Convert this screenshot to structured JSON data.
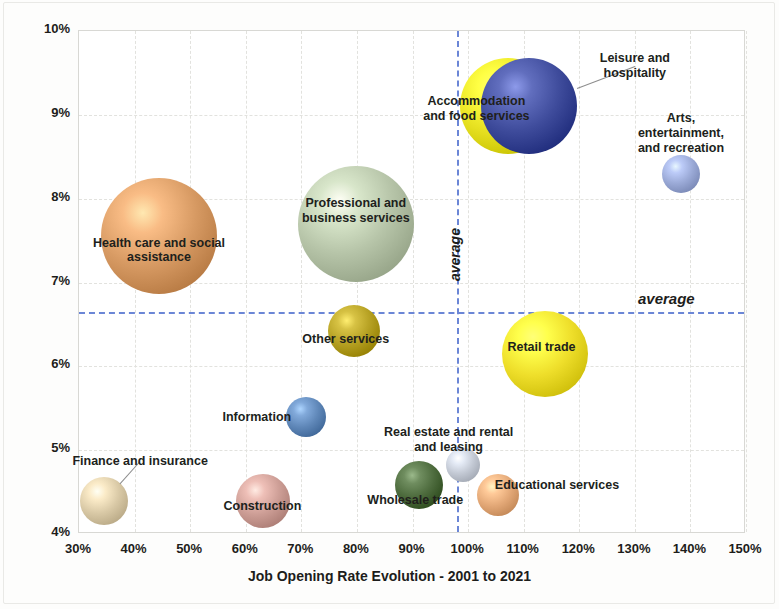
{
  "chart_data": {
    "type": "scatter",
    "title": "",
    "xlabel": "Job Opening Rate Evolution - 2001 to 2021",
    "ylabel": "Job Opening Rate (as a % Jobs) in 2021",
    "xlim": [
      30,
      150
    ],
    "ylim": [
      4,
      10
    ],
    "xticks": [
      "30%",
      "40%",
      "50%",
      "60%",
      "70%",
      "80%",
      "90%",
      "100%",
      "110%",
      "120%",
      "130%",
      "140%",
      "150%"
    ],
    "yticks": [
      "4%",
      "5%",
      "6%",
      "7%",
      "8%",
      "9%",
      "10%"
    ],
    "grid": true,
    "legend": "none",
    "annotations": [
      {
        "text": "average",
        "orientation": "vertical",
        "x": 98
      },
      {
        "text": "average",
        "orientation": "horizontal",
        "y": 6.65
      }
    ],
    "reference_lines": {
      "vertical_average_x": 98,
      "horizontal_average_y": 6.65,
      "color": "#6b86d6",
      "style": "dashed"
    },
    "points": [
      {
        "label": "Health care and social\nassistance",
        "x": 44.4,
        "y": 7.55,
        "size_r": 58,
        "color": "#d79a63",
        "label_x": 44.4,
        "label_y": 7.38,
        "leader": false
      },
      {
        "label": "Professional and\nbusiness services",
        "x": 79.8,
        "y": 7.7,
        "size_r": 58,
        "color": "#b6c4a8",
        "label_x": 79.8,
        "label_y": 7.85,
        "leader": false
      },
      {
        "label": "Accommodation\nand food services",
        "x": 107.2,
        "y": 9.1,
        "size_r": 48,
        "color": "#e8e222",
        "label_x": 101.5,
        "label_y": 9.07,
        "leader": false
      },
      {
        "label": "Leisure and hospitality",
        "x": 111.0,
        "y": 9.1,
        "size_r": 48,
        "color": "#3f4c9c",
        "label_x": 130.0,
        "label_y": 9.58,
        "leader": true
      },
      {
        "label": "Arts, entertainment,\nand recreation",
        "x": 138.3,
        "y": 8.3,
        "size_r": 19,
        "color": "#9aa9d6",
        "label_x": 138.3,
        "label_y": 8.78,
        "leader": false
      },
      {
        "label": "Other services",
        "x": 79.5,
        "y": 6.42,
        "size_r": 26,
        "color": "#b5a022",
        "label_x": 78.0,
        "label_y": 6.33,
        "leader": false
      },
      {
        "label": "Retail trade",
        "x": 113.8,
        "y": 6.15,
        "size_r": 43,
        "color": "#eede2a",
        "label_x": 113.2,
        "label_y": 6.23,
        "leader": false
      },
      {
        "label": "Information",
        "x": 70.8,
        "y": 5.4,
        "size_r": 20,
        "color": "#5f87b8",
        "label_x": 62.0,
        "label_y": 5.4,
        "leader": false
      },
      {
        "label": "Real estate and rental\nand leasing",
        "x": 99.0,
        "y": 4.82,
        "size_r": 17,
        "color": "#c3c9d4",
        "label_x": 96.5,
        "label_y": 5.12,
        "leader": false
      },
      {
        "label": "Wholesale trade",
        "x": 91.2,
        "y": 4.59,
        "size_r": 24,
        "color": "#4d6b3d",
        "label_x": 90.5,
        "label_y": 4.4,
        "leader": false
      },
      {
        "label": "Educational services",
        "x": 105.4,
        "y": 4.47,
        "size_r": 21,
        "color": "#e3a877",
        "label_x": 116.0,
        "label_y": 4.58,
        "leader": false
      },
      {
        "label": "Construction",
        "x": 63.1,
        "y": 4.39,
        "size_r": 27,
        "color": "#cc9d95",
        "label_x": 63.0,
        "label_y": 4.33,
        "leader": false
      },
      {
        "label": "Finance and insurance",
        "x": 34.5,
        "y": 4.39,
        "size_r": 24,
        "color": "#d9c9a6",
        "label_x": 41.0,
        "label_y": 4.87,
        "leader": true
      }
    ]
  },
  "axes": {
    "x_title": "Job Opening Rate Evolution - 2001 to 2021",
    "y_title": "Job Opening Rate (as a % Jobs) in 2021"
  },
  "labels": {
    "average_vertical": "average",
    "average_horizontal": "average"
  }
}
